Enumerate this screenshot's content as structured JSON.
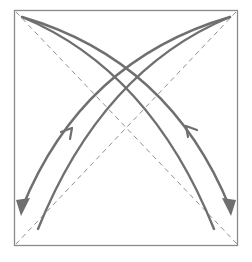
{
  "diagram": {
    "type": "origami-fold-diagram",
    "colors": {
      "border": "#8a8a8a",
      "dashed_line": "#8f8f8f",
      "arrow": "#6f6f6f",
      "background": "#ffffff"
    },
    "square": {
      "x": 14,
      "y": 10,
      "width": 224,
      "height": 236
    },
    "fold_lines": [
      {
        "name": "diagonal-tl-br",
        "style": "dashed",
        "from": [
          16,
          12
        ],
        "to": [
          237,
          244
        ]
      },
      {
        "name": "diagonal-tr-bl",
        "style": "dashed",
        "from": [
          236,
          12
        ],
        "to": [
          16,
          244
        ]
      }
    ],
    "arrows": [
      {
        "name": "arrow-tl-to-br",
        "from_corner": "top-left",
        "to_corner": "bottom-right",
        "heads": [
          "bottom-right",
          "middle-up-left"
        ]
      },
      {
        "name": "arrow-tr-to-bl",
        "from_corner": "top-right",
        "to_corner": "bottom-left",
        "heads": [
          "bottom-left",
          "middle-up-right"
        ]
      }
    ]
  }
}
